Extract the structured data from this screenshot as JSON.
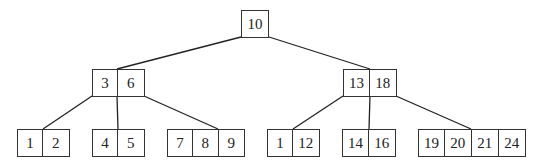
{
  "diagram": {
    "type": "b-tree",
    "line_color": "#222222",
    "box_border_color": "#333333",
    "nodes": {
      "root": {
        "keys": [
          "10"
        ],
        "x": 241,
        "y": 10,
        "cell_widths": [
          28
        ]
      },
      "internal_left": {
        "keys": [
          "3",
          "6"
        ],
        "x": 92,
        "y": 69,
        "cell_widths": [
          26,
          27
        ]
      },
      "internal_right": {
        "keys": [
          "13",
          "18"
        ],
        "x": 343,
        "y": 69,
        "cell_widths": [
          27,
          27
        ]
      },
      "leaf_1": {
        "keys": [
          "1",
          "2"
        ],
        "x": 17,
        "y": 129,
        "cell_widths": [
          26,
          27
        ]
      },
      "leaf_2": {
        "keys": [
          "4",
          "5"
        ],
        "x": 92,
        "y": 129,
        "cell_widths": [
          26,
          27
        ]
      },
      "leaf_3": {
        "keys": [
          "7",
          "8",
          "9"
        ],
        "x": 167,
        "y": 129,
        "cell_widths": [
          26,
          26,
          26
        ]
      },
      "leaf_4": {
        "keys": [
          "1",
          "12"
        ],
        "x": 267,
        "y": 129,
        "cell_widths": [
          26,
          27
        ]
      },
      "leaf_5": {
        "keys": [
          "14",
          "16"
        ],
        "x": 342,
        "y": 129,
        "cell_widths": [
          27,
          27
        ]
      },
      "leaf_6": {
        "keys": [
          "19",
          "20",
          "21",
          "24"
        ],
        "x": 418,
        "y": 129,
        "cell_widths": [
          27,
          27,
          27,
          27
        ]
      }
    },
    "edges": [
      {
        "from": "root",
        "to": "internal_left",
        "x1": 241,
        "y1": 37,
        "x2": 117,
        "y2": 69
      },
      {
        "from": "root",
        "to": "internal_right",
        "x1": 269,
        "y1": 37,
        "x2": 370,
        "y2": 69
      },
      {
        "from": "internal_left",
        "to": "leaf_1",
        "x1": 92,
        "y1": 96,
        "x2": 43,
        "y2": 129
      },
      {
        "from": "internal_left",
        "to": "leaf_2",
        "x1": 117,
        "y1": 96,
        "x2": 118,
        "y2": 129
      },
      {
        "from": "internal_left",
        "to": "leaf_3",
        "x1": 144,
        "y1": 96,
        "x2": 218,
        "y2": 129
      },
      {
        "from": "internal_right",
        "to": "leaf_4",
        "x1": 343,
        "y1": 96,
        "x2": 293,
        "y2": 129
      },
      {
        "from": "internal_right",
        "to": "leaf_5",
        "x1": 370,
        "y1": 96,
        "x2": 369,
        "y2": 129
      },
      {
        "from": "internal_right",
        "to": "leaf_6",
        "x1": 396,
        "y1": 96,
        "x2": 471,
        "y2": 129
      }
    ]
  }
}
